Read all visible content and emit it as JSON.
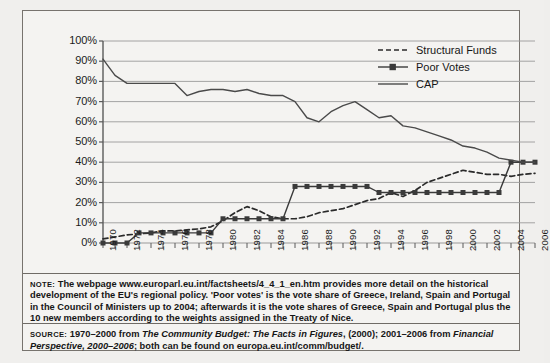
{
  "figure": {
    "note": {
      "kicker": "NOTE:",
      "text": " The webpage www.europarl.eu.int/factsheets/4_4_1_en.htm provides more detail on the historical development of the EU's regional policy. 'Poor votes' is the vote share of Greece, Ireland, Spain and Portugal in the Council of Ministers up to 2004; afterwards it is the vote shares of Greece, Spain and Portugal plus the 10 new members according to the weights assigned in the Treaty of Nice."
    },
    "source": {
      "kicker": "SOURCE:",
      "part1": " 1970–2000 from ",
      "italic1": "The Community Budget: The Facts in Figures",
      "part2": ", (2000); 2001–2006 from ",
      "italic2": "Financial Perspective, 2000–2006",
      "part3": "; both can be found on europa.eu.int/comm/budget/."
    }
  },
  "chart_data": {
    "type": "line",
    "title": "",
    "subtitle": "",
    "xlabel": "",
    "ylabel": "",
    "grid": true,
    "legend_position": "top-right",
    "ylim": [
      0,
      100
    ],
    "yticks": [
      0,
      10,
      20,
      30,
      40,
      50,
      60,
      70,
      80,
      90,
      100
    ],
    "ytick_labels": [
      "0%",
      "10%",
      "20%",
      "30%",
      "40%",
      "50%",
      "60%",
      "70%",
      "80%",
      "90%",
      "100%"
    ],
    "xlim": [
      1970,
      2006
    ],
    "xticks": [
      1970,
      1971,
      1972,
      1973,
      1974,
      1975,
      1976,
      1977,
      1978,
      1979,
      1980,
      1981,
      1982,
      1983,
      1984,
      1985,
      1986,
      1987,
      1988,
      1989,
      1990,
      1991,
      1992,
      1993,
      1994,
      1995,
      1996,
      1997,
      1998,
      1999,
      2000,
      2001,
      2002,
      2003,
      2004,
      2005,
      2006
    ],
    "xtick_labels": [
      "1970",
      "1972",
      "1974",
      "1976",
      "1978",
      "1980",
      "1982",
      "1984",
      "1986",
      "1988",
      "1990",
      "1992",
      "1994",
      "1996",
      "1998",
      "2000",
      "2002",
      "2004",
      "2006"
    ],
    "xtick_label_years": [
      1970,
      1972,
      1974,
      1976,
      1978,
      1980,
      1982,
      1984,
      1986,
      1988,
      1990,
      1992,
      1994,
      1996,
      1998,
      2000,
      2002,
      2004,
      2006
    ],
    "x": [
      1970,
      1971,
      1972,
      1973,
      1974,
      1975,
      1976,
      1977,
      1978,
      1979,
      1980,
      1981,
      1982,
      1983,
      1984,
      1985,
      1986,
      1987,
      1988,
      1989,
      1990,
      1991,
      1992,
      1993,
      1994,
      1995,
      1996,
      1997,
      1998,
      1999,
      2000,
      2001,
      2002,
      2003,
      2004,
      2005,
      2006
    ],
    "series": [
      {
        "name": "Structural Funds",
        "style": "dashed",
        "marker": "none",
        "color": "#2a2a2a",
        "values": [
          2,
          3,
          4,
          4.5,
          5,
          6,
          6,
          6.5,
          7,
          8,
          11,
          15,
          18,
          16,
          13,
          12,
          12,
          13,
          15,
          16,
          17,
          19,
          21,
          22,
          25,
          23,
          26,
          30,
          32,
          34,
          36,
          35,
          34,
          34,
          33,
          34,
          34.5
        ]
      },
      {
        "name": "Poor Votes",
        "style": "solid",
        "marker": "square",
        "color": "#3a3a3a",
        "values": [
          0,
          0,
          0,
          5,
          5,
          5,
          5,
          5,
          5,
          5,
          12,
          12,
          12,
          12,
          12,
          12,
          28,
          28,
          28,
          28,
          28,
          28,
          28,
          25,
          25,
          25,
          25,
          25,
          25,
          25,
          25,
          25,
          25,
          25,
          40,
          40,
          40
        ]
      },
      {
        "name": "CAP",
        "style": "solid",
        "marker": "none",
        "color": "#4a4a4a",
        "values": [
          91,
          83,
          79,
          79,
          79,
          79,
          79,
          73,
          75,
          76,
          76,
          75,
          76,
          74,
          73,
          73,
          70,
          62,
          60,
          65,
          68,
          70,
          66,
          62,
          63,
          58,
          57,
          55,
          53,
          51,
          48,
          47,
          45,
          42,
          41,
          40,
          40
        ]
      }
    ]
  }
}
